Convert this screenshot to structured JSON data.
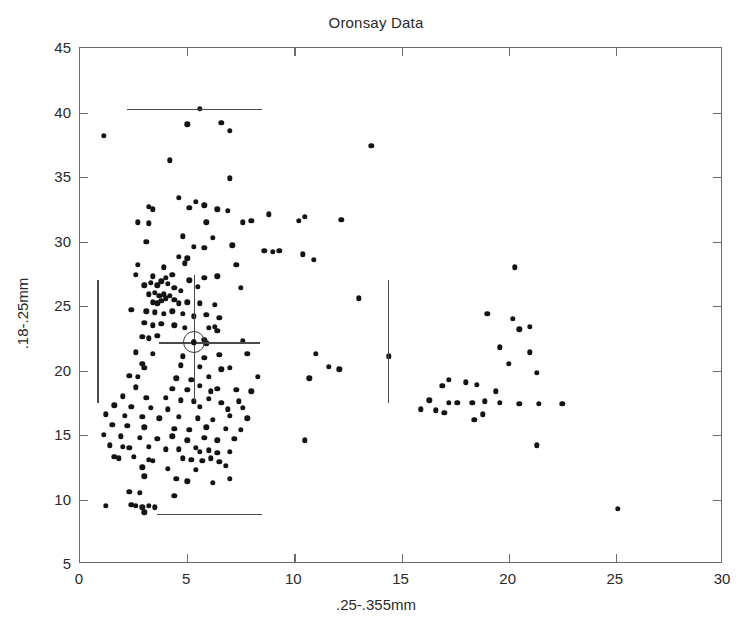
{
  "chart_data": {
    "type": "scatter",
    "title": "Oronsay Data",
    "xlabel": ".25-.355mm",
    "ylabel": ".18-.25mm",
    "xlim": [
      0,
      30
    ],
    "ylim": [
      5,
      45
    ],
    "xticks": [
      0,
      5,
      10,
      15,
      20,
      25,
      30
    ],
    "yticks": [
      5,
      10,
      15,
      20,
      25,
      30,
      35,
      40,
      45
    ],
    "xticklabels": [
      "0",
      "5",
      "10",
      "15",
      "20",
      "25",
      "30"
    ],
    "yticklabels": [
      "5",
      "10",
      "15",
      "20",
      "25",
      "30",
      "35",
      "40",
      "45"
    ],
    "grid": false,
    "legend": null,
    "marker": "filled-circle",
    "marker_color": "#141414",
    "series": [
      {
        "name": "Oronsay samples",
        "points": [
          [
            1.1,
            38.2
          ],
          [
            5.6,
            40.3
          ],
          [
            5.0,
            39.1
          ],
          [
            6.6,
            39.2
          ],
          [
            7.0,
            38.6
          ],
          [
            13.6,
            37.4
          ],
          [
            4.2,
            36.3
          ],
          [
            7.0,
            34.9
          ],
          [
            4.6,
            33.4
          ],
          [
            5.4,
            33.1
          ],
          [
            5.1,
            32.6
          ],
          [
            5.8,
            32.8
          ],
          [
            6.4,
            32.5
          ],
          [
            6.9,
            32.4
          ],
          [
            8.8,
            32.1
          ],
          [
            3.2,
            32.7
          ],
          [
            3.4,
            32.5
          ],
          [
            2.7,
            31.5
          ],
          [
            3.2,
            31.4
          ],
          [
            5.9,
            31.5
          ],
          [
            7.6,
            31.5
          ],
          [
            8.0,
            31.6
          ],
          [
            10.2,
            31.6
          ],
          [
            10.5,
            31.9
          ],
          [
            12.2,
            31.7
          ],
          [
            4.8,
            30.4
          ],
          [
            6.2,
            30.3
          ],
          [
            3.1,
            30.0
          ],
          [
            5.3,
            29.6
          ],
          [
            5.8,
            29.5
          ],
          [
            7.1,
            29.7
          ],
          [
            8.6,
            29.3
          ],
          [
            9.0,
            29.2
          ],
          [
            9.3,
            29.3
          ],
          [
            10.4,
            29.0
          ],
          [
            4.6,
            28.8
          ],
          [
            5.0,
            28.7
          ],
          [
            4.9,
            28.3
          ],
          [
            2.7,
            28.2
          ],
          [
            3.9,
            28.0
          ],
          [
            7.3,
            28.2
          ],
          [
            10.9,
            28.6
          ],
          [
            20.3,
            28.0
          ],
          [
            2.6,
            27.4
          ],
          [
            3.4,
            27.3
          ],
          [
            4.0,
            27.2
          ],
          [
            4.3,
            27.4
          ],
          [
            5.1,
            27.0
          ],
          [
            5.8,
            27.2
          ],
          [
            6.4,
            27.3
          ],
          [
            3.0,
            26.6
          ],
          [
            3.3,
            26.8
          ],
          [
            3.6,
            26.6
          ],
          [
            3.8,
            26.9
          ],
          [
            4.1,
            26.7
          ],
          [
            4.4,
            26.4
          ],
          [
            4.7,
            26.2
          ],
          [
            5.5,
            26.5
          ],
          [
            7.5,
            26.4
          ],
          [
            3.2,
            25.9
          ],
          [
            3.5,
            26.0
          ],
          [
            3.7,
            25.8
          ],
          [
            3.9,
            25.9
          ],
          [
            4.0,
            25.6
          ],
          [
            4.2,
            25.8
          ],
          [
            4.4,
            25.5
          ],
          [
            3.4,
            25.3
          ],
          [
            3.6,
            25.2
          ],
          [
            3.8,
            25.4
          ],
          [
            4.6,
            25.2
          ],
          [
            5.0,
            25.3
          ],
          [
            5.6,
            25.2
          ],
          [
            6.3,
            25.1
          ],
          [
            13.0,
            25.6
          ],
          [
            2.4,
            24.7
          ],
          [
            3.1,
            24.6
          ],
          [
            3.5,
            24.5
          ],
          [
            3.9,
            24.4
          ],
          [
            4.3,
            24.6
          ],
          [
            4.8,
            24.4
          ],
          [
            5.3,
            24.2
          ],
          [
            5.9,
            24.3
          ],
          [
            6.5,
            24.1
          ],
          [
            19.0,
            24.4
          ],
          [
            20.2,
            24.0
          ],
          [
            3.0,
            23.7
          ],
          [
            3.4,
            23.5
          ],
          [
            3.8,
            23.6
          ],
          [
            4.4,
            23.5
          ],
          [
            4.9,
            23.3
          ],
          [
            6.0,
            23.3
          ],
          [
            6.3,
            23.4
          ],
          [
            6.4,
            23.1
          ],
          [
            20.5,
            23.2
          ],
          [
            21.0,
            23.4
          ],
          [
            2.9,
            22.6
          ],
          [
            3.2,
            22.5
          ],
          [
            3.6,
            22.7
          ],
          [
            5.3,
            22.2
          ],
          [
            5.8,
            22.4
          ],
          [
            5.9,
            22.1
          ],
          [
            7.6,
            22.3
          ],
          [
            19.6,
            21.8
          ],
          [
            21.0,
            21.4
          ],
          [
            2.6,
            21.4
          ],
          [
            3.4,
            21.3
          ],
          [
            4.8,
            21.1
          ],
          [
            5.8,
            21.0
          ],
          [
            6.5,
            21.2
          ],
          [
            7.8,
            21.3
          ],
          [
            11.0,
            21.3
          ],
          [
            14.4,
            21.1
          ],
          [
            2.9,
            20.5
          ],
          [
            3.0,
            20.2
          ],
          [
            4.7,
            20.4
          ],
          [
            5.6,
            20.3
          ],
          [
            6.6,
            20.1
          ],
          [
            7.0,
            20.2
          ],
          [
            11.6,
            20.3
          ],
          [
            12.1,
            20.1
          ],
          [
            20.0,
            20.5
          ],
          [
            21.3,
            19.8
          ],
          [
            2.3,
            19.6
          ],
          [
            2.7,
            19.5
          ],
          [
            4.5,
            19.4
          ],
          [
            5.2,
            19.3
          ],
          [
            6.0,
            19.5
          ],
          [
            8.3,
            19.5
          ],
          [
            10.7,
            19.4
          ],
          [
            17.2,
            19.3
          ],
          [
            18.0,
            19.1
          ],
          [
            2.6,
            18.7
          ],
          [
            4.3,
            18.6
          ],
          [
            5.0,
            18.5
          ],
          [
            5.6,
            18.8
          ],
          [
            6.1,
            18.4
          ],
          [
            6.4,
            18.6
          ],
          [
            7.3,
            18.5
          ],
          [
            8.0,
            18.4
          ],
          [
            16.9,
            18.8
          ],
          [
            18.5,
            18.9
          ],
          [
            19.4,
            18.4
          ],
          [
            2.0,
            18.0
          ],
          [
            3.1,
            17.9
          ],
          [
            4.0,
            17.9
          ],
          [
            4.7,
            17.7
          ],
          [
            5.3,
            17.6
          ],
          [
            6.0,
            17.8
          ],
          [
            6.6,
            17.5
          ],
          [
            7.4,
            17.6
          ],
          [
            16.3,
            17.7
          ],
          [
            17.2,
            17.5
          ],
          [
            17.6,
            17.5
          ],
          [
            18.3,
            17.5
          ],
          [
            18.9,
            17.6
          ],
          [
            19.6,
            17.5
          ],
          [
            20.5,
            17.4
          ],
          [
            21.4,
            17.4
          ],
          [
            22.5,
            17.4
          ],
          [
            1.6,
            17.3
          ],
          [
            2.4,
            17.2
          ],
          [
            3.3,
            17.1
          ],
          [
            4.1,
            17.0
          ],
          [
            5.6,
            17.2
          ],
          [
            6.9,
            17.0
          ],
          [
            7.6,
            17.1
          ],
          [
            15.9,
            17.0
          ],
          [
            16.6,
            16.9
          ],
          [
            17.0,
            16.7
          ],
          [
            18.8,
            16.6
          ],
          [
            1.2,
            16.6
          ],
          [
            2.1,
            16.5
          ],
          [
            2.9,
            16.4
          ],
          [
            3.7,
            16.3
          ],
          [
            4.6,
            16.4
          ],
          [
            5.5,
            16.3
          ],
          [
            6.2,
            16.2
          ],
          [
            7.0,
            16.5
          ],
          [
            7.8,
            16.3
          ],
          [
            18.4,
            16.2
          ],
          [
            1.5,
            15.8
          ],
          [
            2.2,
            15.7
          ],
          [
            3.0,
            15.6
          ],
          [
            4.4,
            15.5
          ],
          [
            5.1,
            15.4
          ],
          [
            5.9,
            15.6
          ],
          [
            6.8,
            15.5
          ],
          [
            7.5,
            15.4
          ],
          [
            10.5,
            14.6
          ],
          [
            1.1,
            15.0
          ],
          [
            1.9,
            14.9
          ],
          [
            2.8,
            14.8
          ],
          [
            3.6,
            14.7
          ],
          [
            4.3,
            14.9
          ],
          [
            5.0,
            14.6
          ],
          [
            5.8,
            14.8
          ],
          [
            6.4,
            14.6
          ],
          [
            7.2,
            14.7
          ],
          [
            21.3,
            14.2
          ],
          [
            1.4,
            14.2
          ],
          [
            2.0,
            14.1
          ],
          [
            2.3,
            14.0
          ],
          [
            3.2,
            14.1
          ],
          [
            4.0,
            13.9
          ],
          [
            4.6,
            13.9
          ],
          [
            5.4,
            14.0
          ],
          [
            5.6,
            13.7
          ],
          [
            6.0,
            13.8
          ],
          [
            6.4,
            13.6
          ],
          [
            7.0,
            13.7
          ],
          [
            1.6,
            13.3
          ],
          [
            1.8,
            13.2
          ],
          [
            2.5,
            13.3
          ],
          [
            3.2,
            13.1
          ],
          [
            3.4,
            13.0
          ],
          [
            4.8,
            13.2
          ],
          [
            5.2,
            13.1
          ],
          [
            5.7,
            13.0
          ],
          [
            6.1,
            13.2
          ],
          [
            6.5,
            12.9
          ],
          [
            2.9,
            12.5
          ],
          [
            4.1,
            12.4
          ],
          [
            5.4,
            12.3
          ],
          [
            6.8,
            12.6
          ],
          [
            3.0,
            11.8
          ],
          [
            4.5,
            11.6
          ],
          [
            5.0,
            11.4
          ],
          [
            6.2,
            11.3
          ],
          [
            7.0,
            11.6
          ],
          [
            2.3,
            10.6
          ],
          [
            2.8,
            10.5
          ],
          [
            4.4,
            10.3
          ],
          [
            1.2,
            9.5
          ],
          [
            2.4,
            9.6
          ],
          [
            2.6,
            9.5
          ],
          [
            2.9,
            9.4
          ],
          [
            3.2,
            9.5
          ],
          [
            3.5,
            9.4
          ],
          [
            3.0,
            9.0
          ],
          [
            25.1,
            9.3
          ]
        ]
      }
    ],
    "annotations": {
      "center_marker": {
        "name": "circled-cross-centroid",
        "x": 5.3,
        "y": 22.2,
        "hwhisker": [
          3.7,
          8.4
        ],
        "vwhisker": [
          17.6,
          27.4
        ]
      },
      "reference_lines": [
        {
          "name": "top-horizontal-whisker",
          "orientation": "horizontal",
          "y": 40.3,
          "x_from": 2.2,
          "x_to": 8.5
        },
        {
          "name": "bottom-horizontal-whisker",
          "orientation": "horizontal",
          "y": 8.9,
          "x_from": 3.6,
          "x_to": 8.5
        },
        {
          "name": "left-vertical-whisker",
          "orientation": "vertical",
          "x": 0.8,
          "y_from": 17.5,
          "y_to": 27.0
        },
        {
          "name": "right-vertical-whisker",
          "orientation": "vertical",
          "x": 14.35,
          "y_from": 17.5,
          "y_to": 27.0
        }
      ]
    }
  }
}
